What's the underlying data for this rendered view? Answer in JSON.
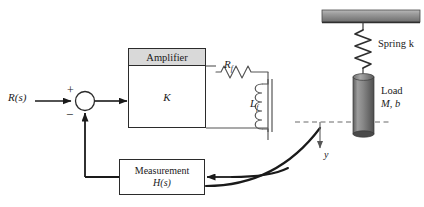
{
  "diagram": {
    "type": "block-diagram"
  },
  "input": {
    "label": "R(s)",
    "name": "reference-input"
  },
  "summing_junction": {
    "plus_sign": "+",
    "minus_sign": "−"
  },
  "amplifier": {
    "title": "Amplifier",
    "gain_label": "K",
    "title_bar_color": "#d9d9d9",
    "border_color": "#2b2b2b"
  },
  "field_circuit": {
    "resistor_label": "R",
    "resistor_sub": "f",
    "inductor_label": "L",
    "inductor_sub": "f"
  },
  "measurement": {
    "line1": "Measurement",
    "line2": "H(s)"
  },
  "mechanical": {
    "spring_label": "Spring k",
    "load_label_line1": "Load",
    "load_label_line2": "M, b",
    "displacement_label": "y",
    "ceiling_color": "#8c8c8c",
    "load_color": "#7d7d7d"
  },
  "colors": {
    "line": "#1a1a1a",
    "text": "#1a1a1a",
    "background": "#ffffff"
  }
}
